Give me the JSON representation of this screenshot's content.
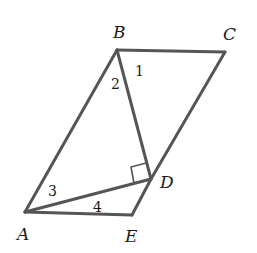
{
  "diagram": {
    "type": "geometry",
    "stroke_color": "#555555",
    "vertices": {
      "A": {
        "label": "A",
        "x": 25,
        "y": 212
      },
      "B": {
        "label": "B",
        "x": 117,
        "y": 50
      },
      "C": {
        "label": "C",
        "x": 225,
        "y": 52
      },
      "D": {
        "label": "D",
        "x": 151,
        "y": 179
      },
      "E": {
        "label": "E",
        "x": 132,
        "y": 215
      }
    },
    "segments": [
      "AB",
      "BC",
      "CD",
      "DE",
      "EA",
      "BD",
      "AD"
    ],
    "angle_labels": [
      {
        "label": "1",
        "at": "B",
        "x": 138,
        "y": 76
      },
      {
        "label": "2",
        "at": "B",
        "x": 111,
        "y": 89
      },
      {
        "label": "3",
        "at": "A",
        "x": 48,
        "y": 196
      },
      {
        "label": "4",
        "at": "A",
        "x": 93,
        "y": 212
      }
    ],
    "right_angle_marker": {
      "at": "D",
      "between": [
        "BD",
        "AD"
      ]
    }
  }
}
